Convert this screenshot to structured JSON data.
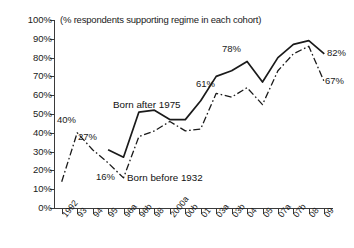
{
  "chart_data": {
    "type": "line",
    "title": "(% respondents supporting regime in each cohort)",
    "xlabel": "",
    "ylabel": "",
    "ylim": [
      0,
      100
    ],
    "ytick_labels": [
      "100%",
      "90%",
      "80%",
      "70%",
      "60%",
      "50%",
      "40%",
      "30%",
      "20%",
      "10%",
      "0%"
    ],
    "ytick_values": [
      100,
      90,
      80,
      70,
      60,
      50,
      40,
      30,
      20,
      10,
      0
    ],
    "grid": false,
    "legend_position": "inline-annotation",
    "categories": [
      "1992",
      "93",
      "94",
      "95",
      "96a",
      "96b",
      "98",
      "2000a",
      "00b",
      "01",
      "03a",
      "03b",
      "04",
      "05",
      "07a",
      "07b",
      "08",
      "09"
    ],
    "series": [
      {
        "name": "Born before 1932",
        "style": "dash-dot",
        "color": "#1a1a1a",
        "values": [
          14,
          40,
          31,
          24,
          16,
          38,
          41,
          46,
          41,
          42,
          61,
          59,
          64,
          55,
          73,
          82,
          86,
          67
        ]
      },
      {
        "name": "Born after 1975",
        "style": "solid",
        "color": "#1a1a1a",
        "values": [
          null,
          null,
          null,
          31,
          27,
          51,
          52,
          47,
          47,
          57,
          70,
          73,
          78,
          67,
          80,
          87,
          89,
          82
        ]
      }
    ],
    "point_labels": [
      {
        "text": "40%",
        "series": "Born before 1932",
        "category": "93",
        "value": 40
      },
      {
        "text": "16%",
        "series": "Born before 1932",
        "category": "96a",
        "value": 16
      },
      {
        "text": "61%",
        "series": "Born before 1932",
        "category": "03a",
        "value": 61
      },
      {
        "text": "67%",
        "series": "Born before 1932",
        "category": "09",
        "value": 67
      },
      {
        "text": "27%",
        "series": "Born after 1975",
        "category": "96a",
        "value": 27
      },
      {
        "text": "78%",
        "series": "Born after 1975",
        "category": "04",
        "value": 78
      },
      {
        "text": "82%",
        "series": "Born after 1975",
        "category": "09",
        "value": 82
      }
    ],
    "annotations": [
      {
        "text": "Born after 1975"
      },
      {
        "text": "Born before 1932"
      }
    ]
  },
  "labels": {
    "title": "(% respondents supporting regime in each cohort)",
    "legend_after": "Born after 1975",
    "legend_before": "Born before 1932",
    "p40": "40%",
    "p27": "27%",
    "p16": "16%",
    "p61": "61%",
    "p78": "78%",
    "p82": "82%",
    "p67": "67%"
  }
}
